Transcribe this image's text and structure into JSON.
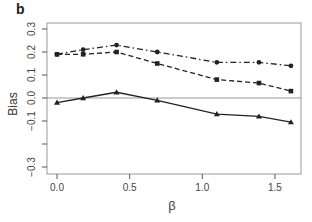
{
  "panel_label": "b",
  "chart_data": {
    "type": "line",
    "title": "",
    "panel": "b",
    "xlabel": "β",
    "ylabel": "Bias",
    "xlim": [
      -0.04,
      1.68
    ],
    "ylim": [
      -0.33,
      0.33
    ],
    "x_ticks": [
      0.0,
      0.5,
      1.0,
      1.5
    ],
    "x_tick_labels": [
      "0.0",
      "0.5",
      "1.0",
      "1.5"
    ],
    "y_ticks": [
      -0.3,
      -0.2,
      -0.1,
      0.0,
      0.1,
      0.2,
      0.3
    ],
    "y_tick_labels": [
      "−0.3",
      "",
      "−0.1",
      "0.0",
      "0.1",
      "0.2",
      "0.3"
    ],
    "reference_line": {
      "y": 0.0,
      "color": "#888888"
    },
    "grid": false,
    "legend": null,
    "x": [
      0.0,
      0.18,
      0.41,
      0.69,
      1.1,
      1.39,
      1.61
    ],
    "series": [
      {
        "name": "circle dash-dot",
        "marker": "circle",
        "linestyle": "dashdot",
        "color": "#222222",
        "values": [
          0.19,
          0.21,
          0.23,
          0.2,
          0.155,
          0.155,
          0.14
        ]
      },
      {
        "name": "square dashed",
        "marker": "square",
        "linestyle": "dashed",
        "color": "#222222",
        "values": [
          0.19,
          0.19,
          0.2,
          0.15,
          0.08,
          0.065,
          0.03
        ]
      },
      {
        "name": "triangle solid",
        "marker": "triangle",
        "linestyle": "solid",
        "color": "#222222",
        "values": [
          -0.02,
          0.0,
          0.025,
          -0.01,
          -0.07,
          -0.08,
          -0.105
        ]
      }
    ],
    "colors": {
      "axis": "#555555",
      "box": "#999999",
      "reference": "#999999",
      "series": "#222222"
    }
  }
}
